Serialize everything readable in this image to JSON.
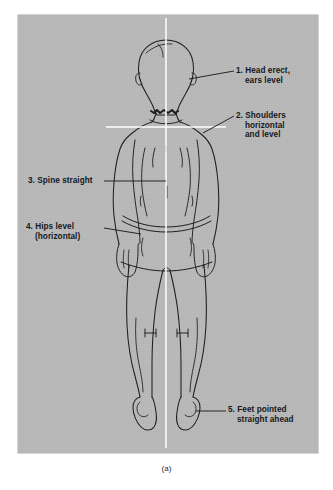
{
  "figure": {
    "caption": "(a)",
    "panel_color": "#b9b9b9",
    "ink_color": "#1b1e22",
    "reference_line_color": "#ffffff",
    "reference_lines": {
      "vertical_plumb_line": "vertical white plumb line through center of body",
      "horizontal_shoulder_line": "horizontal white line across shoulders"
    }
  },
  "annotations": [
    {
      "number": "1.",
      "line1": "Head erect,",
      "line2": "ears level",
      "leader": "from right ear to label"
    },
    {
      "number": "2.",
      "line1": "Shoulders",
      "line2": "horizontal",
      "line3": "and level",
      "leader": "from right shoulder to label"
    },
    {
      "number": "3.",
      "line1": "Spine straight",
      "line2": "",
      "leader": "from label to mid-spine"
    },
    {
      "number": "4.",
      "line1": "Hips level",
      "line2": "(horizontal)",
      "leader": "from label to left hip"
    },
    {
      "number": "5.",
      "line1": "Feet pointed",
      "line2": "straight ahead",
      "leader": "from right heel to label"
    }
  ]
}
